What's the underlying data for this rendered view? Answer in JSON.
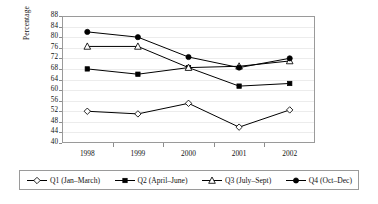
{
  "chart_data": {
    "type": "line",
    "title": "",
    "xlabel": "",
    "ylabel": "Percentage",
    "categories": [
      "1998",
      "1999",
      "2000",
      "2001",
      "2002"
    ],
    "ylim": [
      40,
      88
    ],
    "yticks": [
      40,
      44,
      48,
      52,
      56,
      60,
      64,
      68,
      72,
      76,
      80,
      84,
      88
    ],
    "grid": true,
    "legend_position": "bottom",
    "series": [
      {
        "name": "Q1 (Jan–March)",
        "marker": "open-diamond",
        "color": "#000000",
        "values": [
          52,
          51,
          55,
          46,
          52.5
        ]
      },
      {
        "name": "Q2 (April–June)",
        "marker": "filled-square",
        "color": "#000000",
        "values": [
          68,
          66,
          68.5,
          61.5,
          62.5
        ]
      },
      {
        "name": "Q3 (July–Sept)",
        "marker": "open-triangle",
        "color": "#000000",
        "values": [
          76.5,
          76.5,
          68.5,
          69,
          71
        ]
      },
      {
        "name": "Q4 (Oct–Dec)",
        "marker": "filled-circle",
        "color": "#000000",
        "values": [
          82,
          80,
          72.5,
          68.5,
          72
        ]
      }
    ]
  },
  "legend": {
    "items": [
      {
        "label": "Q1 (Jan–March)"
      },
      {
        "label": "Q2 (April–June)"
      },
      {
        "label": "Q3 (July–Sept)"
      },
      {
        "label": "Q4 (Oct–Dec)"
      }
    ]
  },
  "colors": {
    "line": "#000000",
    "frame": "#9a9a9a",
    "grid": "#ececec",
    "text": "#111111",
    "background": "#ffffff"
  }
}
